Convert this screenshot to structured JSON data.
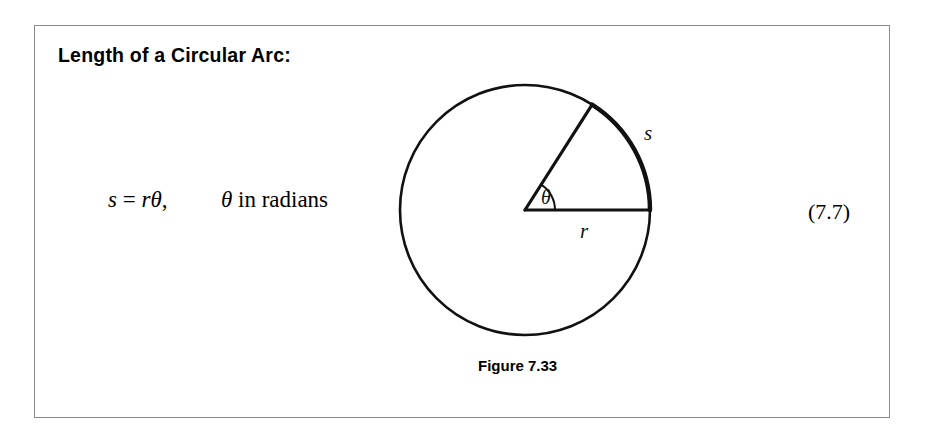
{
  "page": {
    "background_color": "#ffffff",
    "width": 925,
    "height": 425
  },
  "frame": {
    "border_color": "#8a8a8a"
  },
  "title": "Length of a Circular Arc:",
  "formula": {
    "variable_s": "s",
    "equals": "=",
    "variable_r": "r",
    "symbol_theta": "θ",
    "comma": ",",
    "condition_theta": "θ",
    "condition_text": "in radians",
    "full_text": "s = rθ,    θ in radians"
  },
  "equation_number": "(7.7)",
  "caption": "Figure 7.33",
  "diagram": {
    "stroke_color": "#111111",
    "circle": {
      "center_x": 145,
      "center_y": 132,
      "radius": 125,
      "stroke_width": 2.6
    },
    "radius_horizontal": {
      "label": "r",
      "label_x": 205,
      "label_y": 158,
      "angle_degrees": 0,
      "end_x": 270,
      "end_y": 132
    },
    "radius_angled": {
      "angle_degrees": 57.5,
      "end_x": 212,
      "end_y": 26
    },
    "arc": {
      "label": "s",
      "label_x": 266,
      "label_y": 62,
      "start_angle_degrees": 0,
      "end_angle_degrees": 57.5
    },
    "angle": {
      "label": "θ",
      "label_x": 168,
      "label_y": 120,
      "arc_radius": 30
    }
  }
}
